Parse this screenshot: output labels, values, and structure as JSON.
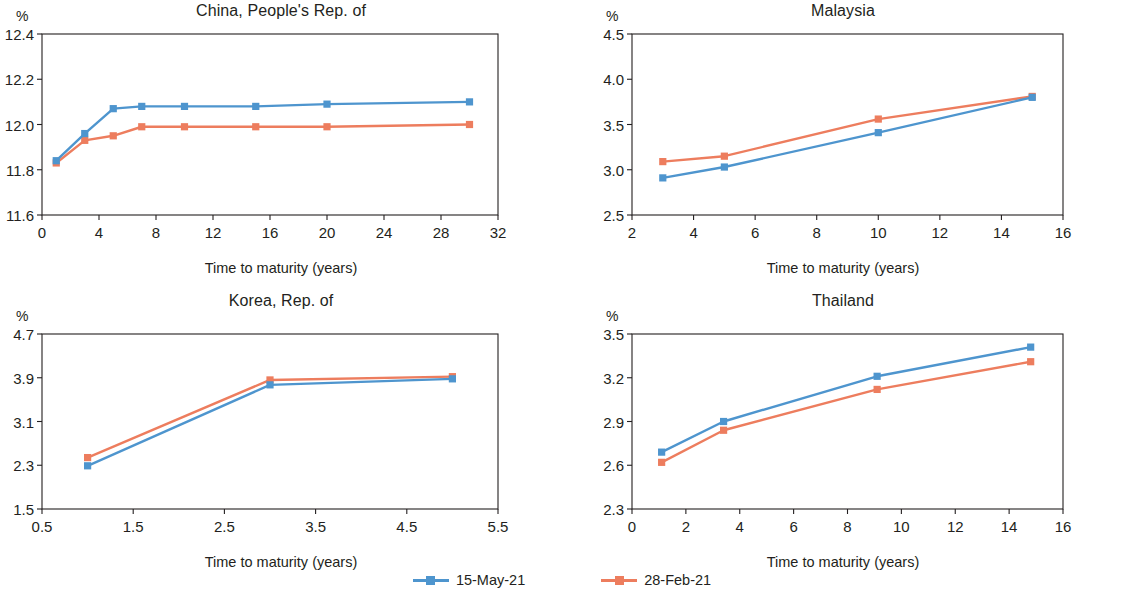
{
  "figure": {
    "background": "#ffffff",
    "series_colors": {
      "current": "#4E95CE",
      "previous": "#ED7D5E"
    },
    "axis_color": "#231f20",
    "x_axis_title": "Time to maturity (years)",
    "unit_label": "%"
  },
  "legend": {
    "position": "bottom-center",
    "entries": [
      {
        "label": "15-May-21",
        "color": "#4E95CE",
        "marker": "square"
      },
      {
        "label": "28-Feb-21",
        "color": "#ED7D5E",
        "marker": "square"
      }
    ]
  },
  "chart_data": [
    {
      "type": "line",
      "panel": "top-left",
      "title": "China, People's Rep. of",
      "xlabel": "Time to maturity (years)",
      "ylabel": "%",
      "xlim": [
        0,
        32
      ],
      "ylim": [
        11.6,
        12.4
      ],
      "xticks": [
        0,
        4,
        8,
        12,
        16,
        20,
        24,
        28,
        32
      ],
      "yticks": [
        11.6,
        11.8,
        12.0,
        12.2,
        12.4
      ],
      "xtick_labels": [
        "0",
        "4",
        "8",
        "12",
        "16",
        "20",
        "24",
        "28",
        "32"
      ],
      "ytick_labels": [
        "11.6",
        "11.8",
        "12.0",
        "12.2",
        "12.4"
      ],
      "grid": false,
      "x": [
        1,
        3,
        5,
        7,
        10,
        15,
        20,
        30
      ],
      "series": [
        {
          "name": "15-May-21",
          "color": "#4E95CE",
          "values": [
            11.84,
            11.96,
            12.07,
            12.08,
            12.08,
            12.08,
            12.09,
            12.1
          ]
        },
        {
          "name": "28-Feb-21",
          "color": "#ED7D5E",
          "values": [
            11.83,
            11.93,
            11.95,
            11.99,
            11.99,
            11.99,
            11.99,
            12.0
          ]
        }
      ]
    },
    {
      "type": "line",
      "panel": "top-right",
      "title": "Malaysia",
      "xlabel": "Time to maturity (years)",
      "ylabel": "%",
      "xlim": [
        2,
        16
      ],
      "ylim": [
        2.5,
        4.5
      ],
      "xticks": [
        2,
        4,
        6,
        8,
        10,
        12,
        14,
        16
      ],
      "yticks": [
        2.5,
        3.0,
        3.5,
        4.0,
        4.5
      ],
      "xtick_labels": [
        "2",
        "4",
        "6",
        "8",
        "10",
        "12",
        "14",
        "16"
      ],
      "ytick_labels": [
        "2.5",
        "3.0",
        "3.5",
        "4.0",
        "4.5"
      ],
      "grid": false,
      "x": [
        3,
        5,
        10,
        15
      ],
      "series": [
        {
          "name": "15-May-21",
          "color": "#4E95CE",
          "values": [
            2.91,
            3.03,
            3.41,
            3.8
          ]
        },
        {
          "name": "28-Feb-21",
          "color": "#ED7D5E",
          "values": [
            3.09,
            3.15,
            3.56,
            3.81
          ]
        }
      ]
    },
    {
      "type": "line",
      "panel": "bottom-left",
      "title": "Korea, Rep. of",
      "xlabel": "Time to maturity (years)",
      "ylabel": "%",
      "xlim": [
        0.5,
        5.5
      ],
      "ylim": [
        1.5,
        4.7
      ],
      "xticks": [
        0.5,
        1.5,
        2.5,
        3.5,
        4.5,
        5.5
      ],
      "yticks": [
        1.5,
        2.3,
        3.1,
        3.9,
        4.7
      ],
      "xtick_labels": [
        "0.5",
        "1.5",
        "2.5",
        "3.5",
        "4.5",
        "5.5"
      ],
      "ytick_labels": [
        "1.5",
        "2.3",
        "3.1",
        "3.9",
        "4.7"
      ],
      "grid": false,
      "x": [
        1,
        3,
        5
      ],
      "series": [
        {
          "name": "15-May-21",
          "color": "#4E95CE",
          "values": [
            2.29,
            3.77,
            3.88
          ]
        },
        {
          "name": "28-Feb-21",
          "color": "#ED7D5E",
          "values": [
            2.44,
            3.86,
            3.92
          ]
        }
      ]
    },
    {
      "type": "line",
      "panel": "bottom-right",
      "title": "Thailand",
      "xlabel": "Time to maturity (years)",
      "ylabel": "%",
      "xlim": [
        0,
        16
      ],
      "ylim": [
        2.3,
        3.5
      ],
      "xticks": [
        0,
        2,
        4,
        6,
        8,
        10,
        12,
        14,
        16
      ],
      "yticks": [
        2.3,
        2.6,
        2.9,
        3.2,
        3.5
      ],
      "xtick_labels": [
        "0",
        "2",
        "4",
        "6",
        "8",
        "10",
        "12",
        "14",
        "16"
      ],
      "ytick_labels": [
        "2.3",
        "2.6",
        "2.9",
        "3.2",
        "3.5"
      ],
      "grid": false,
      "x": [
        1.1,
        3.4,
        9.1,
        14.8
      ],
      "series": [
        {
          "name": "15-May-21",
          "color": "#4E95CE",
          "values": [
            2.69,
            2.9,
            3.21,
            3.41
          ]
        },
        {
          "name": "28-Feb-21",
          "color": "#ED7D5E",
          "values": [
            2.62,
            2.84,
            3.12,
            3.31
          ]
        }
      ]
    }
  ],
  "layout": {
    "panels": [
      {
        "key": "china",
        "left": 0,
        "top": 0,
        "width": 562,
        "height": 290,
        "plot_left": 42,
        "plot_top": 34,
        "plot_width": 456,
        "plot_height": 181
      },
      {
        "key": "malaysia",
        "left": 562,
        "top": 0,
        "width": 562,
        "height": 290,
        "plot_left": 70,
        "plot_top": 34,
        "plot_width": 431,
        "plot_height": 181
      },
      {
        "key": "korea",
        "left": 0,
        "top": 290,
        "width": 562,
        "height": 290,
        "plot_left": 42,
        "plot_top": 44,
        "plot_width": 456,
        "plot_height": 175
      },
      {
        "key": "thailand",
        "left": 562,
        "top": 290,
        "width": 562,
        "height": 290,
        "plot_left": 70,
        "plot_top": 44,
        "plot_width": 431,
        "plot_height": 175
      }
    ]
  }
}
